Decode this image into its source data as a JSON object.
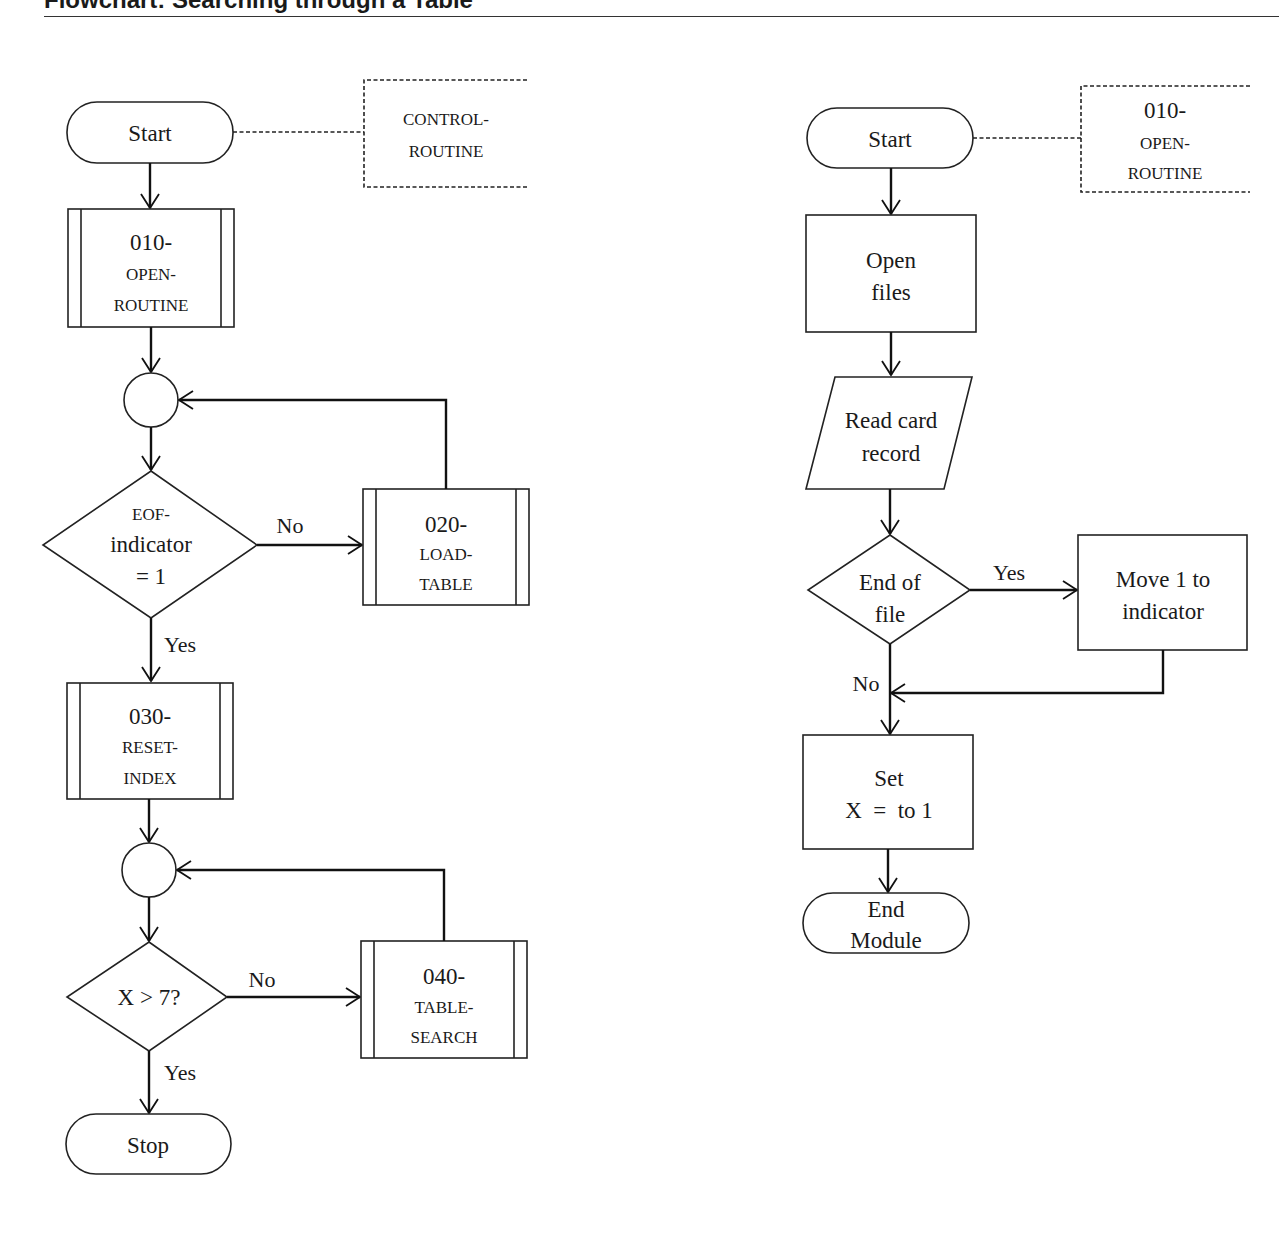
{
  "header": {
    "title": "Flowchart: Searching through a Table"
  },
  "left_chart": {
    "start": "Start",
    "annotation": [
      "CONTROL-",
      "ROUTINE"
    ],
    "open_routine": {
      "code": "010-",
      "name_lines": [
        "OPEN-",
        "ROUTINE"
      ]
    },
    "decision_eof": [
      "EOF-",
      "indicator",
      "= 1"
    ],
    "decision_eof_no": "No",
    "decision_eof_yes": "Yes",
    "load_table": {
      "code": "020-",
      "name_lines": [
        "LOAD-",
        "TABLE"
      ]
    },
    "reset_index": {
      "code": "030-",
      "name_lines": [
        "RESET-",
        "INDEX"
      ]
    },
    "decision_x": "X > 7?",
    "decision_x_no": "No",
    "decision_x_yes": "Yes",
    "table_search": {
      "code": "040-",
      "name_lines": [
        "TABLE-",
        "SEARCH"
      ]
    },
    "stop": "Stop"
  },
  "right_chart": {
    "start": "Start",
    "annotation": {
      "code": "010-",
      "name_lines": [
        "OPEN-",
        "ROUTINE"
      ]
    },
    "open_files": [
      "Open",
      "files"
    ],
    "read_record": [
      "Read card",
      "record"
    ],
    "decision_eof": [
      "End of",
      "file"
    ],
    "decision_yes": "Yes",
    "decision_no": "No",
    "move_indicator": [
      "Move 1 to",
      "indicator"
    ],
    "set_x": [
      "Set",
      "X  =  to 1"
    ],
    "end": [
      "End",
      "Module"
    ]
  }
}
